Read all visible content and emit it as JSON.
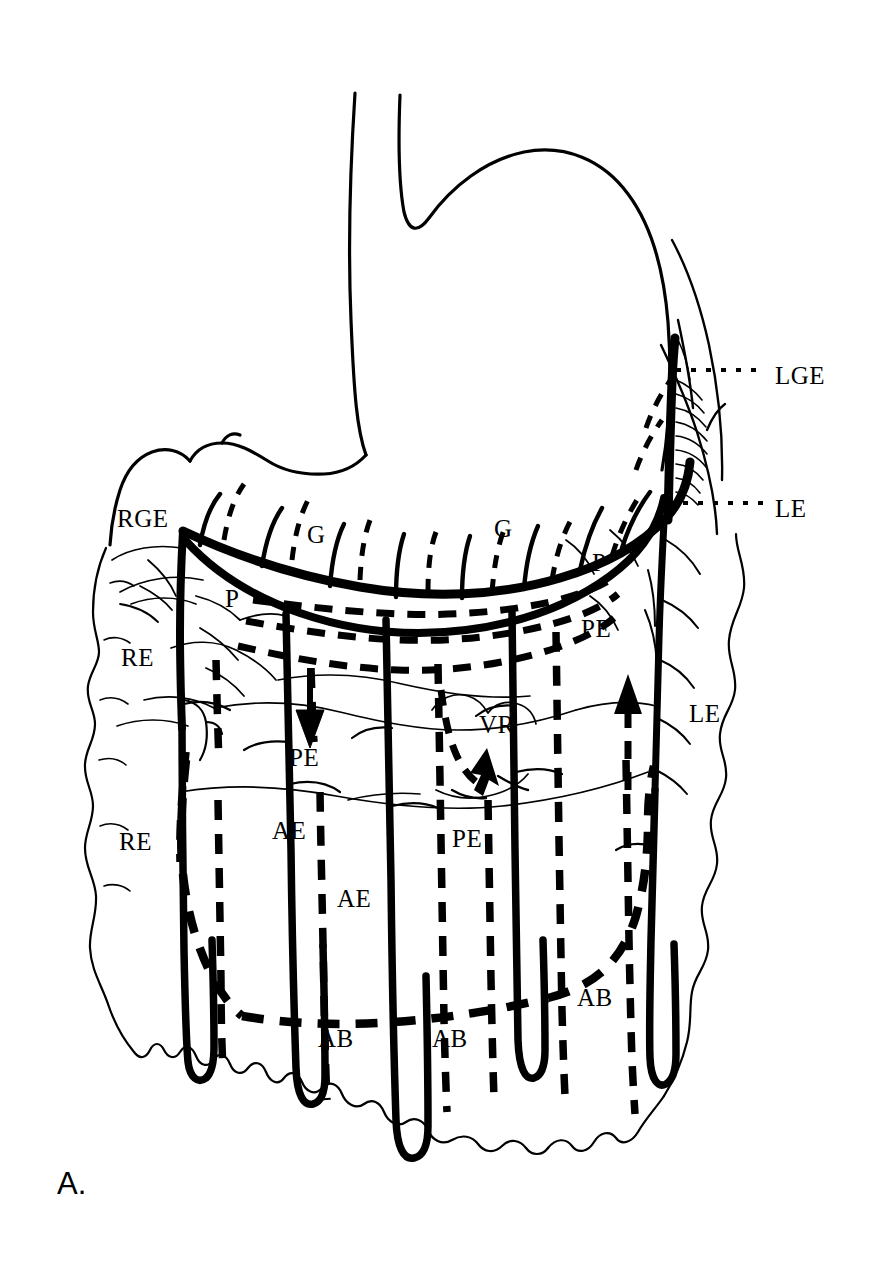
{
  "figure": {
    "panel_label": "A.",
    "ink_color": "#000000",
    "background_color": "#ffffff",
    "width": 870,
    "height": 1268
  },
  "labels": [
    {
      "id": "lge",
      "text": "LGE",
      "x": 775,
      "y": 375,
      "leader": "dotted"
    },
    {
      "id": "le-top",
      "text": "LE",
      "x": 775,
      "y": 508,
      "leader": "dotted"
    },
    {
      "id": "rge",
      "text": "RGE",
      "x": 117,
      "y": 518,
      "leader": "none"
    },
    {
      "id": "g-1",
      "text": "G",
      "x": 307,
      "y": 534,
      "leader": "none"
    },
    {
      "id": "g-2",
      "text": "G",
      "x": 494,
      "y": 528,
      "leader": "none"
    },
    {
      "id": "p-left",
      "text": "P",
      "x": 225,
      "y": 598,
      "leader": "none"
    },
    {
      "id": "p-right",
      "text": "P",
      "x": 592,
      "y": 562,
      "leader": "none"
    },
    {
      "id": "pe-right",
      "text": "PE",
      "x": 581,
      "y": 628,
      "leader": "none"
    },
    {
      "id": "re-upper",
      "text": "RE",
      "x": 121,
      "y": 657,
      "leader": "none"
    },
    {
      "id": "vr",
      "text": "VR",
      "x": 479,
      "y": 724,
      "leader": "none"
    },
    {
      "id": "le-side",
      "text": "LE",
      "x": 689,
      "y": 713,
      "leader": "none"
    },
    {
      "id": "pe-left",
      "text": "PE",
      "x": 289,
      "y": 757,
      "leader": "none"
    },
    {
      "id": "ae-1",
      "text": "AE",
      "x": 272,
      "y": 830,
      "leader": "none"
    },
    {
      "id": "re-lower",
      "text": "RE",
      "x": 119,
      "y": 841,
      "leader": "none"
    },
    {
      "id": "pe-mid",
      "text": "PE",
      "x": 452,
      "y": 838,
      "leader": "none"
    },
    {
      "id": "ae-2",
      "text": "AE",
      "x": 337,
      "y": 898,
      "leader": "none"
    },
    {
      "id": "ab-right",
      "text": "AB",
      "x": 577,
      "y": 997,
      "leader": "none"
    },
    {
      "id": "ab-1",
      "text": "AB",
      "x": 318,
      "y": 1038,
      "leader": "none"
    },
    {
      "id": "ab-2",
      "text": "AB",
      "x": 432,
      "y": 1038,
      "leader": "none"
    }
  ],
  "legend_meanings": {
    "LGE": "Left gastroepiploic artery",
    "RGE": "Right gastroepiploic artery",
    "LE": "Left epiploic artery",
    "RE": "Right epiploic artery",
    "G": "Gastric branch",
    "P": "Perforating branch",
    "PE": "Posterior epiploic artery",
    "AE": "Anterior epiploic artery",
    "AB": "Arcade of Barkow",
    "VR": "Vascular ring"
  },
  "line_styles": {
    "solid": "anterior vessels",
    "dashed": "posterior vessels",
    "dotted_leader": "label leader line"
  },
  "arrows": [
    {
      "id": "arrow-down-left",
      "direction": "down",
      "x": 310,
      "y": 735,
      "style": "solid-filled"
    },
    {
      "id": "arrow-up-right",
      "direction": "up",
      "x": 628,
      "y": 710,
      "style": "dashed-filled"
    },
    {
      "id": "arrow-vr-curved",
      "direction": "up-curved",
      "x": 487,
      "y": 790,
      "style": "dashed-filled"
    }
  ]
}
